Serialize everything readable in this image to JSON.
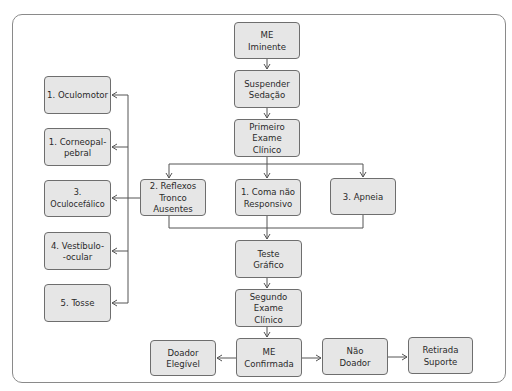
{
  "diagram": {
    "title": "",
    "nodes": {
      "me_iminente": "ME\nIminente",
      "suspender_sedacao": "Suspender\nSedação",
      "primeiro_exame": "Primeiro\nExame\nClínico",
      "reflexos_tronco": "2. Reflexos\nTronco\nAusentes",
      "coma": "1. Coma não\nResponsivo",
      "apneia": "3. Apneia",
      "teste_grafico": "Teste\nGráfico",
      "segundo_exame": "Segundo\nExame\nClínico",
      "me_confirmada": "ME\nConfirmada",
      "doador_elegivel": "Doador\nElegível",
      "nao_doador": "Não\nDoador",
      "retirada_suporte": "Retirada\nSuporte",
      "oculomotor": "1. Oculomotor",
      "corneopalpebral": "1. Corneopal-\npebral",
      "oculocefalico": "3. Oculocefálico",
      "vestibulo_ocular": "4. Vestíbulo-\n-ocular",
      "tosse": "5. Tosse"
    },
    "edges": [
      [
        "me_iminente",
        "suspender_sedacao"
      ],
      [
        "suspender_sedacao",
        "primeiro_exame"
      ],
      [
        "primeiro_exame",
        "reflexos_tronco"
      ],
      [
        "primeiro_exame",
        "coma"
      ],
      [
        "primeiro_exame",
        "apneia"
      ],
      [
        "reflexos_tronco",
        "oculomotor"
      ],
      [
        "reflexos_tronco",
        "corneopalpebral"
      ],
      [
        "reflexos_tronco",
        "oculocefalico"
      ],
      [
        "reflexos_tronco",
        "vestibulo_ocular"
      ],
      [
        "reflexos_tronco",
        "tosse"
      ],
      [
        "reflexos_tronco",
        "teste_grafico"
      ],
      [
        "coma",
        "teste_grafico"
      ],
      [
        "apneia",
        "teste_grafico"
      ],
      [
        "teste_grafico",
        "segundo_exame"
      ],
      [
        "segundo_exame",
        "me_confirmada"
      ],
      [
        "me_confirmada",
        "doador_elegivel"
      ],
      [
        "me_confirmada",
        "nao_doador"
      ],
      [
        "nao_doador",
        "retirada_suporte"
      ]
    ],
    "colors": {
      "box_fill": "#e6e6e6",
      "box_border": "#6e6e6e",
      "line": "#555555",
      "text": "#2a2a2a"
    }
  }
}
